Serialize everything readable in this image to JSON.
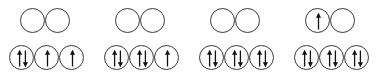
{
  "diagram": {
    "orbital_color": "#3a3a3a",
    "arrow_color": "#111111",
    "background": "#ffffff",
    "groups": [
      {
        "name": "group-1",
        "x": 9,
        "top_row": {
          "x_offset": 11,
          "orbitals": [
            {
              "name": "orbital-top-1",
              "spin": "empty",
              "label": ""
            },
            {
              "name": "orbital-top-2",
              "spin": "empty",
              "label": ""
            }
          ]
        },
        "bottom_row": {
          "x_offset": 0,
          "orbitals": [
            {
              "name": "orbital-bottom-1",
              "spin": "paired",
              "label": "↑↓"
            },
            {
              "name": "orbital-bottom-2",
              "spin": "up",
              "label": "↑"
            },
            {
              "name": "orbital-bottom-3",
              "spin": "up",
              "label": "↑"
            }
          ]
        }
      },
      {
        "name": "group-2",
        "x": 104,
        "top_row": {
          "x_offset": 11,
          "orbitals": [
            {
              "name": "orbital-top-1",
              "spin": "empty",
              "label": ""
            },
            {
              "name": "orbital-top-2",
              "spin": "empty",
              "label": ""
            }
          ]
        },
        "bottom_row": {
          "x_offset": 0,
          "orbitals": [
            {
              "name": "orbital-bottom-1",
              "spin": "paired",
              "label": "↑↓"
            },
            {
              "name": "orbital-bottom-2",
              "spin": "paired",
              "label": "↑↓"
            },
            {
              "name": "orbital-bottom-3",
              "spin": "up",
              "label": "↑"
            }
          ]
        }
      },
      {
        "name": "group-3",
        "x": 199,
        "top_row": {
          "x_offset": 11,
          "orbitals": [
            {
              "name": "orbital-top-1",
              "spin": "empty",
              "label": ""
            },
            {
              "name": "orbital-top-2",
              "spin": "empty",
              "label": ""
            }
          ]
        },
        "bottom_row": {
          "x_offset": 0,
          "orbitals": [
            {
              "name": "orbital-bottom-1",
              "spin": "paired",
              "label": "↑↓"
            },
            {
              "name": "orbital-bottom-2",
              "spin": "paired",
              "label": "↑↓"
            },
            {
              "name": "orbital-bottom-3",
              "spin": "paired",
              "label": "↑↓"
            }
          ]
        }
      },
      {
        "name": "group-4",
        "x": 294,
        "top_row": {
          "x_offset": 11,
          "orbitals": [
            {
              "name": "orbital-top-1",
              "spin": "up",
              "label": "↑"
            },
            {
              "name": "orbital-top-2",
              "spin": "empty",
              "label": ""
            }
          ]
        },
        "bottom_row": {
          "x_offset": 0,
          "orbitals": [
            {
              "name": "orbital-bottom-1",
              "spin": "paired",
              "label": "↑↓"
            },
            {
              "name": "orbital-bottom-2",
              "spin": "paired",
              "label": "↑↓"
            },
            {
              "name": "orbital-bottom-3",
              "spin": "paired",
              "label": "↑↓"
            }
          ]
        }
      }
    ]
  }
}
